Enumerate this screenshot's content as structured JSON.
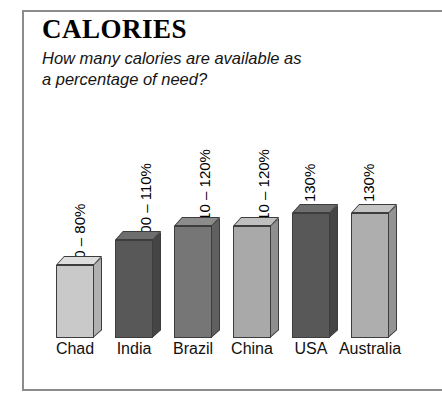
{
  "figure": {
    "title": "CALORIES",
    "subtitle_lines": [
      "How many calories are available as",
      "a percentage of need?"
    ]
  },
  "chart_data": {
    "type": "bar",
    "title": "CALORIES",
    "subtitle": "How many calories are available as a percentage of need?",
    "xlabel": "",
    "ylabel": "",
    "grid": false,
    "legend": "none",
    "orientation": "vertical",
    "style": "3d-block-bars",
    "categories": [
      "Chad",
      "India",
      "Brazil",
      "China",
      "USA",
      "Australia"
    ],
    "value_labels": [
      "70 – 80%",
      "100 – 110%",
      "110 – 120%",
      "110 – 120%",
      "< 130%",
      "< 130%"
    ],
    "values": [
      75,
      105,
      115,
      115,
      130,
      130
    ],
    "value_ranges": [
      [
        70,
        80
      ],
      [
        100,
        110
      ],
      [
        110,
        120
      ],
      [
        110,
        120
      ],
      [
        null,
        130
      ],
      [
        null,
        130
      ]
    ],
    "units": "percent of need",
    "ylim": [
      0,
      140
    ],
    "bar_colors": [
      "#c9c9c9",
      "#585858",
      "#767676",
      "#a9a9a9",
      "#585858",
      "#aeaeae"
    ],
    "bar_top_colors": [
      "#dedede",
      "#6e6e6e",
      "#8c8c8c",
      "#bfbfbf",
      "#6e6e6e",
      "#c4c4c4"
    ],
    "bar_side_colors": [
      "#b0b0b0",
      "#454545",
      "#606060",
      "#8f8f8f",
      "#454545",
      "#949494"
    ],
    "bar_heights_px": [
      73,
      98,
      112,
      112,
      125,
      125
    ]
  }
}
